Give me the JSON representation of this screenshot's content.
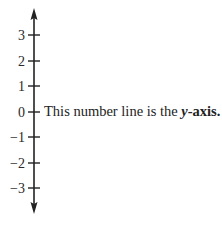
{
  "diagram": {
    "type": "number-line",
    "orientation": "vertical",
    "axis_color": "#222222",
    "ticks": [
      {
        "value": 3,
        "label": "3"
      },
      {
        "value": 2,
        "label": "2"
      },
      {
        "value": 1,
        "label": "1"
      },
      {
        "value": 0,
        "label": "0"
      },
      {
        "value": -1,
        "label": "−1"
      },
      {
        "value": -2,
        "label": "−2"
      },
      {
        "value": -3,
        "label": "−3"
      }
    ],
    "arrows": [
      "up",
      "down"
    ]
  },
  "caption": {
    "prefix": "This number line is the ",
    "variable": "y",
    "suffix": "-axis."
  }
}
